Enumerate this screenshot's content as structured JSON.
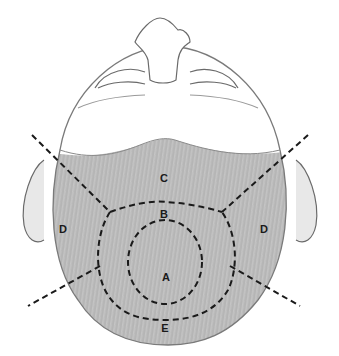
{
  "figure": {
    "zones": [
      {
        "id": "A",
        "label": "A",
        "x": 166,
        "y": 277
      },
      {
        "id": "B",
        "label": "B",
        "x": 164,
        "y": 214
      },
      {
        "id": "C",
        "label": "C",
        "x": 164,
        "y": 178
      },
      {
        "id": "D-left",
        "label": "D",
        "x": 63,
        "y": 229
      },
      {
        "id": "D-right",
        "label": "D",
        "x": 264,
        "y": 229
      },
      {
        "id": "E",
        "label": "E",
        "x": 165,
        "y": 328
      }
    ],
    "colors": {
      "line": "#1a1a1a",
      "skin": "#ffffff",
      "hair": "#9a9a9a",
      "sketch": "#6a6a6a"
    }
  }
}
